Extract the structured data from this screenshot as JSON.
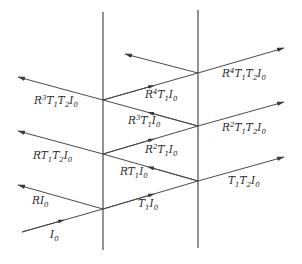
{
  "diagram": {
    "type": "multiple-reflection-ray-diagram",
    "colors": {
      "line": "#4a4a4a",
      "wall": "#3a3a3a",
      "text": "#2a2a2a",
      "background": "#ffffff"
    },
    "walls": [
      {
        "name": "left-interface",
        "x": 103,
        "y1": 12,
        "y2": 250
      },
      {
        "name": "right-interface",
        "x": 198,
        "y1": 10,
        "y2": 248
      }
    ],
    "labels": {
      "incident": {
        "base": "I",
        "sub": "0"
      },
      "reflected_1": {
        "text": "RI",
        "sub": "0"
      },
      "inner_1": {
        "text": "T",
        "sub1": "1",
        "text2": "I",
        "sub2": "0"
      },
      "inner_2": {
        "text": "RT",
        "sub1": "1",
        "text2": "I",
        "sub2": "0"
      },
      "inner_3": {
        "pre": "R",
        "sup": "2",
        "text": "T",
        "sub1": "1",
        "text2": "I",
        "sub2": "0"
      },
      "inner_4": {
        "pre": "R",
        "sup": "3",
        "text": "T",
        "sub1": "1",
        "text2": "I",
        "sub2": "0"
      },
      "inner_5": {
        "pre": "R",
        "sup": "4",
        "text": "T",
        "sub1": "1",
        "text2": "I",
        "sub2": "0"
      },
      "left_out_1": {
        "pre": "R",
        "text": "T",
        "sub1": "1",
        "text2": "T",
        "sub2": "2",
        "text3": "I",
        "sub3": "0"
      },
      "left_out_2": {
        "pre": "R",
        "sup": "3",
        "text": "T",
        "sub1": "1",
        "text2": "T",
        "sub2": "2",
        "text3": "I",
        "sub3": "0"
      },
      "right_out_1": {
        "text": "T",
        "sub1": "1",
        "text2": "T",
        "sub2": "2",
        "text3": "I",
        "sub3": "0"
      },
      "right_out_2": {
        "pre": "R",
        "sup": "2",
        "text": "T",
        "sub1": "1",
        "text2": "T",
        "sub2": "2",
        "text3": "I",
        "sub3": "0"
      },
      "right_out_3": {
        "pre": "R",
        "sup": "4",
        "text": "T",
        "sub1": "1",
        "text2": "T",
        "sub2": "2",
        "text3": "I",
        "sub3": "0"
      }
    },
    "label_strings": [
      "I0",
      "RI0",
      "T1I0",
      "RT1I0",
      "R2T1I0",
      "R3T1I0",
      "R4T1I0",
      "RT1T2I0",
      "R3T1T2I0",
      "T1T2I0",
      "R2T1T2I0",
      "R4T1T2I0"
    ]
  }
}
